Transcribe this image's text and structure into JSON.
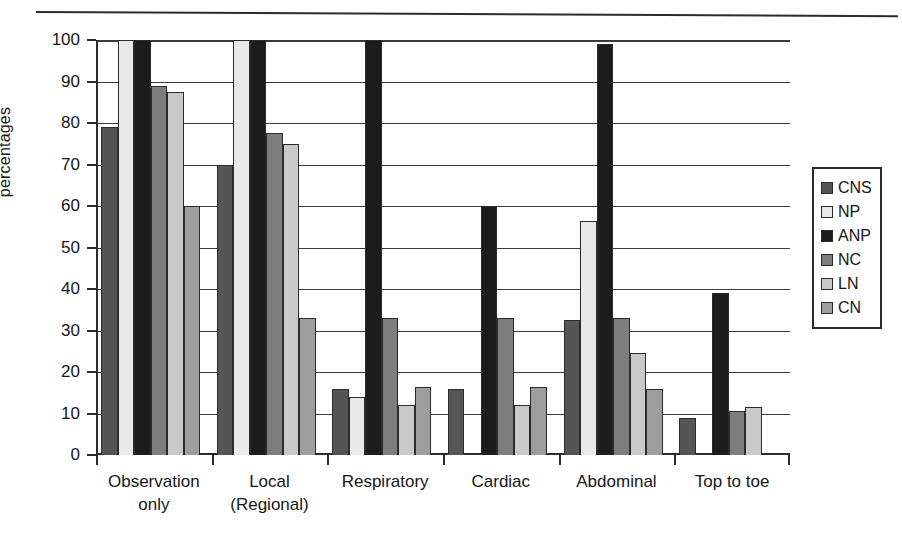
{
  "chart_data": {
    "type": "bar",
    "title": "",
    "subtitle": "",
    "xlabel": "",
    "ylabel": "percentages",
    "ylim": [
      0,
      100
    ],
    "ytick_step": 10,
    "yticks": [
      "0",
      "10",
      "20",
      "30",
      "40",
      "50",
      "60",
      "70",
      "80",
      "90",
      "100"
    ],
    "grid": "horizontal",
    "legend_position": "right",
    "categories": [
      "Observation only",
      "Local (Regional)",
      "Respiratory",
      "Cardiac",
      "Abdominal",
      "Top to toe"
    ],
    "category_lines": [
      [
        "Observation",
        "only"
      ],
      [
        "Local",
        "(Regional)"
      ],
      [
        "Respiratory"
      ],
      [
        "Cardiac"
      ],
      [
        "Abdominal"
      ],
      [
        "Top to toe"
      ]
    ],
    "series": [
      {
        "name": "CNS",
        "color": "#555555",
        "values": [
          79,
          70,
          16,
          16,
          32.5,
          9
        ]
      },
      {
        "name": "NP",
        "color": "#e9e9e9",
        "values": [
          100,
          100,
          14,
          0,
          56.5,
          0
        ]
      },
      {
        "name": "ANP",
        "color": "#1c1c1c",
        "values": [
          100,
          100,
          100,
          60,
          99,
          39
        ]
      },
      {
        "name": "NC",
        "color": "#7d7d7d",
        "values": [
          89,
          77.5,
          33,
          33,
          33,
          10.5
        ]
      },
      {
        "name": "LN",
        "color": "#c9c9c9",
        "values": [
          87.5,
          75,
          12,
          12,
          24.5,
          11.5
        ]
      },
      {
        "name": "CN",
        "color": "#9d9d9d",
        "values": [
          60,
          33,
          16.5,
          16.5,
          16,
          0
        ]
      }
    ]
  },
  "legend": {
    "items": [
      {
        "label": "CNS",
        "color": "#555555"
      },
      {
        "label": "NP",
        "color": "#e9e9e9"
      },
      {
        "label": "ANP",
        "color": "#1c1c1c"
      },
      {
        "label": "NC",
        "color": "#7d7d7d"
      },
      {
        "label": "LN",
        "color": "#c9c9c9"
      },
      {
        "label": "CN",
        "color": "#9d9d9d"
      }
    ]
  },
  "axis": {
    "y_title": "percentages"
  }
}
